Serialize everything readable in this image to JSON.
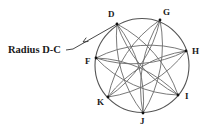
{
  "diagram": {
    "title": "",
    "annotation": {
      "label": "Radius D-C",
      "points_to": "D"
    },
    "circle": {
      "cx": 142,
      "cy": 65.5,
      "r": 47,
      "stroke": "#555555"
    },
    "points": [
      {
        "id": "D",
        "label": "D",
        "x": 117,
        "y": 24,
        "lx": 108,
        "ly": 10
      },
      {
        "id": "G",
        "label": "G",
        "x": 160,
        "y": 20,
        "lx": 163,
        "ly": 8
      },
      {
        "id": "H",
        "label": "H",
        "x": 186,
        "y": 51,
        "lx": 192,
        "ly": 47
      },
      {
        "id": "I",
        "label": "I",
        "x": 178,
        "y": 95,
        "lx": 185,
        "ly": 92
      },
      {
        "id": "J",
        "label": "J",
        "x": 143,
        "y": 113,
        "lx": 140,
        "ly": 117
      },
      {
        "id": "K",
        "label": "K",
        "x": 108,
        "y": 97,
        "lx": 97,
        "ly": 98
      },
      {
        "id": "F",
        "label": "F",
        "x": 96,
        "y": 58,
        "lx": 85,
        "ly": 57
      }
    ],
    "lenses": [
      {
        "from": "D",
        "to": "I"
      },
      {
        "from": "G",
        "to": "J"
      },
      {
        "from": "H",
        "to": "K"
      },
      {
        "from": "I",
        "to": "F"
      },
      {
        "from": "J",
        "to": "D"
      },
      {
        "from": "K",
        "to": "G"
      },
      {
        "from": "F",
        "to": "H"
      }
    ],
    "lens_bulge": 9,
    "leader_line": {
      "points": [
        [
          66,
          50
        ],
        [
          73,
          49
        ],
        [
          117,
          24
        ]
      ],
      "arrowhead_at": [
        83,
        42
      ]
    },
    "colors": {
      "arc": "#6a6a6a",
      "circle": "#555555",
      "text": "#1a1a1a",
      "point": "#111111"
    }
  }
}
